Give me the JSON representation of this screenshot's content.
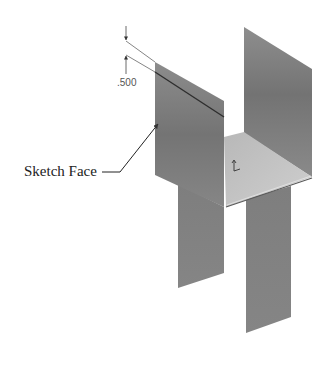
{
  "diagram": {
    "type": "isometric sheet-metal part",
    "callout": {
      "label": "Sketch Face"
    },
    "dimension": {
      "value": ".500"
    },
    "colors": {
      "panel_dark": "#7a7a7a",
      "panel_mid": "#8a8a8a",
      "plate_light": "#c4c4c4",
      "edge_dark": "#3a3a3a",
      "line": "#555555"
    },
    "parts": [
      "left-flange-panel",
      "back-right-flange-panel",
      "base-plate",
      "left-leg-panel",
      "right-leg-panel"
    ]
  }
}
